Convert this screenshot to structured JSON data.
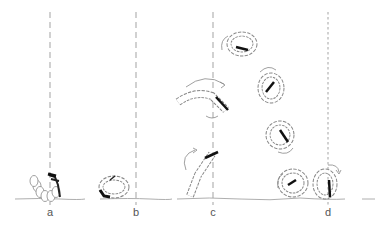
{
  "figure": {
    "type": "sequence-illustration",
    "colors": {
      "ink": "#222222",
      "larva_fill": "#ffffff",
      "larva_stroke": "#777777",
      "guide": "#999999",
      "arrow": "#888888"
    },
    "stages": [
      {
        "id": "a",
        "label": "a",
        "x": 50
      },
      {
        "id": "b",
        "label": "b",
        "x": 136
      },
      {
        "id": "c",
        "label": "c",
        "x": 213
      },
      {
        "id": "d",
        "label": "d",
        "x": 328
      }
    ]
  }
}
